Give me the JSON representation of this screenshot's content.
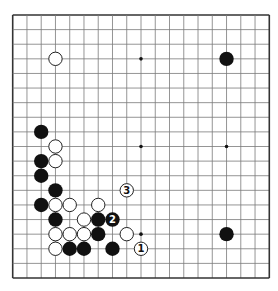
{
  "diagram": {
    "type": "go-board",
    "size": 19,
    "colors": {
      "background": "#ffffff",
      "grid_line": "#7a7a7a",
      "border": "#333333",
      "black_stone": "#111111",
      "white_stone": "#ffffff",
      "white_stone_outline": "#222222",
      "star_point": "#111111"
    },
    "star_points": [
      [
        9,
        3
      ],
      [
        9,
        9
      ],
      [
        15,
        9
      ],
      [
        9,
        15
      ]
    ],
    "stones": [
      {
        "color": "white",
        "col": 3,
        "row": 3
      },
      {
        "color": "black",
        "col": 15,
        "row": 3
      },
      {
        "color": "black",
        "col": 2,
        "row": 8
      },
      {
        "color": "white",
        "col": 3,
        "row": 9
      },
      {
        "color": "black",
        "col": 2,
        "row": 10
      },
      {
        "color": "white",
        "col": 3,
        "row": 10
      },
      {
        "color": "black",
        "col": 2,
        "row": 11
      },
      {
        "color": "black",
        "col": 3,
        "row": 12
      },
      {
        "color": "white",
        "col": 8,
        "row": 12,
        "label": "3"
      },
      {
        "color": "black",
        "col": 2,
        "row": 13
      },
      {
        "color": "white",
        "col": 3,
        "row": 13
      },
      {
        "color": "white",
        "col": 4,
        "row": 13
      },
      {
        "color": "white",
        "col": 6,
        "row": 13
      },
      {
        "color": "black",
        "col": 3,
        "row": 14
      },
      {
        "color": "white",
        "col": 5,
        "row": 14
      },
      {
        "color": "black",
        "col": 6,
        "row": 14
      },
      {
        "color": "black",
        "col": 7,
        "row": 14,
        "label": "2"
      },
      {
        "color": "white",
        "col": 3,
        "row": 15
      },
      {
        "color": "white",
        "col": 4,
        "row": 15
      },
      {
        "color": "white",
        "col": 5,
        "row": 15
      },
      {
        "color": "black",
        "col": 6,
        "row": 15
      },
      {
        "color": "white",
        "col": 8,
        "row": 15
      },
      {
        "color": "black",
        "col": 15,
        "row": 15
      },
      {
        "color": "white",
        "col": 3,
        "row": 16
      },
      {
        "color": "black",
        "col": 4,
        "row": 16
      },
      {
        "color": "black",
        "col": 5,
        "row": 16
      },
      {
        "color": "black",
        "col": 7,
        "row": 16
      },
      {
        "color": "white",
        "col": 9,
        "row": 16,
        "label": "1"
      }
    ]
  }
}
